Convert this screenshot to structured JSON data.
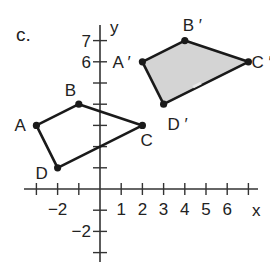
{
  "part_label": "c.",
  "axes": {
    "x_label": "x",
    "y_label": "y",
    "x_ticks": [
      -3,
      -2,
      -1,
      0,
      1,
      2,
      3,
      4,
      5,
      6,
      7
    ],
    "y_ticks": [
      -3,
      -2,
      -1,
      0,
      1,
      2,
      3,
      4,
      5,
      6,
      7
    ],
    "x_tick_labels": [
      {
        "value": -2,
        "text": "−2"
      },
      {
        "value": 1,
        "text": "1"
      },
      {
        "value": 2,
        "text": "2"
      },
      {
        "value": 3,
        "text": "3"
      },
      {
        "value": 4,
        "text": "4"
      },
      {
        "value": 5,
        "text": "5"
      },
      {
        "value": 6,
        "text": "6"
      }
    ],
    "y_tick_labels": [
      {
        "value": 7,
        "text": "7"
      },
      {
        "value": 6,
        "text": "6"
      },
      {
        "value": -2,
        "text": "−2"
      }
    ],
    "unit_px": 21.2,
    "origin_px": [
      100,
      189
    ]
  },
  "figures": {
    "original": {
      "name": "ABCD",
      "fill": "none",
      "vertices": [
        {
          "label": "A",
          "x": -3,
          "y": 3
        },
        {
          "label": "B",
          "x": -1,
          "y": 4
        },
        {
          "label": "C",
          "x": 2,
          "y": 3
        },
        {
          "label": "D",
          "x": -2,
          "y": 1
        }
      ]
    },
    "image": {
      "name": "A'B'C'D'",
      "fill": "#d4d4d4",
      "vertices": [
        {
          "label": "A ′",
          "x": 2,
          "y": 6
        },
        {
          "label": "B ′",
          "x": 4,
          "y": 7
        },
        {
          "label": "C ′",
          "x": 7,
          "y": 6
        },
        {
          "label": "D ′",
          "x": 3,
          "y": 4
        }
      ]
    }
  },
  "colors": {
    "stroke": "#1a1a1a",
    "shade": "#d4d4d4",
    "text": "#222222"
  }
}
